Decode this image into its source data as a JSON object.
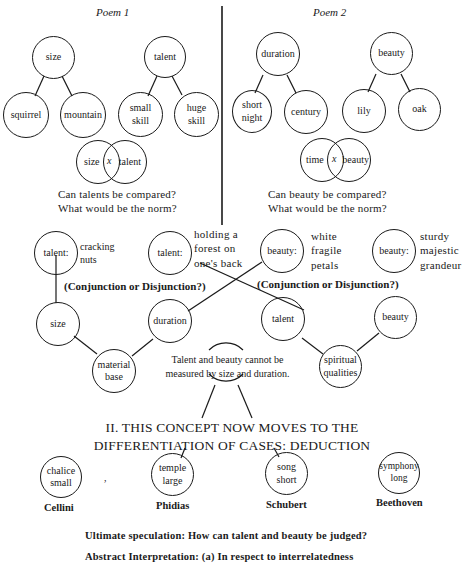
{
  "poem1": {
    "title": "Poem 1",
    "tree_size": {
      "root": "size",
      "children": [
        "squirrel",
        "mountain"
      ]
    },
    "tree_talent": {
      "root": "talent",
      "children": [
        "small\nskill",
        "huge\nskill"
      ]
    },
    "venn": {
      "left": "size",
      "middle": "x",
      "right": "talent"
    },
    "questions": [
      "Can talents be compared?",
      "What would be the norm?"
    ]
  },
  "poem2": {
    "title": "Poem 2",
    "tree_duration": {
      "root": "duration",
      "children": [
        "short\nnight",
        "century"
      ]
    },
    "tree_beauty": {
      "root": "beauty",
      "children": [
        "lily",
        "oak"
      ]
    },
    "venn": {
      "left": "time",
      "middle": "x",
      "right": "beauty"
    },
    "questions": [
      "Can beauty be compared?",
      "What would be the norm?"
    ]
  },
  "middle": {
    "top_nodes": [
      {
        "label": "talent:",
        "note": "cracking\nnuts"
      },
      {
        "label": "talent:",
        "note": "holding a\nforest on\none's back"
      },
      {
        "label": "beauty:",
        "note": "white\nfragile\npetals"
      },
      {
        "label": "beauty:",
        "note": "sturdy\nmajestic\ngrandeur"
      }
    ],
    "conjunction_left": "(Conjunction or Disjunction?)",
    "conjunction_right": "(Conjunction or Disjunction?)",
    "lower_nodes": [
      "size",
      "duration",
      "talent",
      "beauty"
    ],
    "bottom_nodes": [
      "material\nbase",
      "spiritual\nqualities"
    ],
    "center_note": "Talent and beauty cannot be\nmeasured by size and duration."
  },
  "section": {
    "heading": "II.  THIS CONCEPT NOW MOVES TO THE\nDIFFERENTIATION OF CASES:  DEDUCTION",
    "cases": [
      {
        "label": "chalice\nsmall",
        "name": "Cellini"
      },
      {
        "label": "temple\nlarge",
        "name": "Phidias"
      },
      {
        "label": "song\nshort",
        "name": "Schubert"
      },
      {
        "label": "symphony\nlong",
        "name": "Beethoven"
      }
    ]
  },
  "footer": {
    "line1": "Ultimate speculation:  How can talent and beauty be judged?",
    "line2": "Abstract Interpretation:  (a) In respect to interrelatedness"
  }
}
